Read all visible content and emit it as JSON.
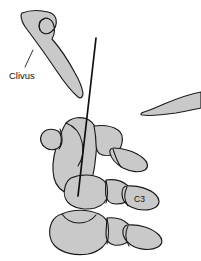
{
  "figure": {
    "background_color": "#ffffff",
    "bone_fill_color": "#c9c9c9",
    "outline_color": "#1a1a1a",
    "needle_color": "#101010",
    "width": 201,
    "height": 261
  },
  "labels": {
    "clivus": "Clivus",
    "c3": "C3"
  },
  "structures": [
    {
      "name": "clivus",
      "label": "Clivus",
      "region": "skull-base"
    },
    {
      "name": "occipital-wedge",
      "label": "",
      "region": "posterior-skull"
    },
    {
      "name": "atlas-axis-complex",
      "label": "",
      "region": "upper-cervical"
    },
    {
      "name": "c3-vertebra",
      "label": "C3",
      "region": "cervical"
    },
    {
      "name": "c4-vertebra",
      "label": "",
      "region": "cervical"
    },
    {
      "name": "needle-trajectory",
      "label": "",
      "region": "instrument"
    }
  ]
}
